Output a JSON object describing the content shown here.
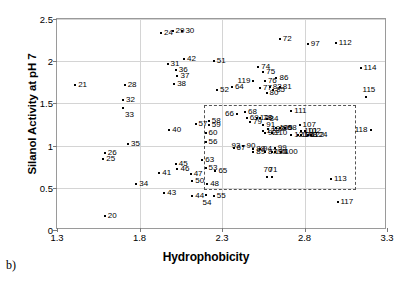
{
  "panel": {
    "letter": "b)"
  },
  "axes": {
    "xlabel": "Hydrophobicity",
    "ylabel": "Silanol Activity at pH 7",
    "xticks": [
      "1.3",
      "1.8",
      "2.3",
      "2.8",
      "3.3"
    ],
    "yticks": [
      "0",
      "0.5",
      "1",
      "1.5",
      "2",
      "2.5"
    ]
  },
  "chart_data": {
    "type": "scatter",
    "title": "",
    "xlabel": "Hydrophobicity",
    "ylabel": "Silanol Activity at pH 7",
    "xlim": [
      1.3,
      3.3
    ],
    "ylim": [
      0,
      2.5
    ],
    "xticks": [
      1.3,
      1.8,
      2.3,
      2.8,
      3.3
    ],
    "yticks": [
      0,
      0.5,
      1,
      1.5,
      2,
      2.5
    ],
    "grid": true,
    "legend": "none",
    "marker": "dot",
    "point_labels": true,
    "annotations": [
      {
        "type": "dashed-rectangle",
        "x0": 2.19,
        "x1": 3.11,
        "y0": 0.47,
        "y1": 1.48
      }
    ],
    "points": [
      {
        "label": "20",
        "x": 1.59,
        "y": 0.17,
        "lp": "lab-r"
      },
      {
        "label": "21",
        "x": 1.41,
        "y": 1.72,
        "lp": "lab-r"
      },
      {
        "label": "24",
        "x": 1.93,
        "y": 2.33,
        "lp": "lab-r"
      },
      {
        "label": "25",
        "x": 1.58,
        "y": 0.84,
        "lp": "lab-r"
      },
      {
        "label": "26",
        "x": 1.59,
        "y": 0.91,
        "lp": "lab-r"
      },
      {
        "label": "28",
        "x": 1.71,
        "y": 1.72,
        "lp": "lab-r"
      },
      {
        "label": "29",
        "x": 2.0,
        "y": 2.36,
        "lp": "lab-r"
      },
      {
        "label": "30",
        "x": 2.06,
        "y": 2.36,
        "lp": "lab-r"
      },
      {
        "label": "31",
        "x": 1.97,
        "y": 1.97,
        "lp": "lab-r"
      },
      {
        "label": "32",
        "x": 1.7,
        "y": 1.54,
        "lp": "lab-r"
      },
      {
        "label": "33",
        "x": 1.7,
        "y": 1.45,
        "lp": "lab-br"
      },
      {
        "label": "34",
        "x": 1.78,
        "y": 0.54,
        "lp": "lab-r"
      },
      {
        "label": "35",
        "x": 1.73,
        "y": 1.02,
        "lp": "lab-r"
      },
      {
        "label": "36",
        "x": 2.02,
        "y": 1.9,
        "lp": "lab-r"
      },
      {
        "label": "37",
        "x": 2.03,
        "y": 1.83,
        "lp": "lab-r"
      },
      {
        "label": "38",
        "x": 2.01,
        "y": 1.73,
        "lp": "lab-r"
      },
      {
        "label": "40",
        "x": 1.98,
        "y": 1.18,
        "lp": "lab-r"
      },
      {
        "label": "41",
        "x": 1.92,
        "y": 0.67,
        "lp": "lab-r"
      },
      {
        "label": "42",
        "x": 2.07,
        "y": 2.03,
        "lp": "lab-r"
      },
      {
        "label": "43",
        "x": 1.95,
        "y": 0.44,
        "lp": "lab-r"
      },
      {
        "label": "44",
        "x": 2.12,
        "y": 0.4,
        "lp": "lab-r"
      },
      {
        "label": "45",
        "x": 2.02,
        "y": 0.78,
        "lp": "lab-r"
      },
      {
        "label": "46",
        "x": 2.03,
        "y": 0.72,
        "lp": "lab-r"
      },
      {
        "label": "47",
        "x": 2.11,
        "y": 0.66,
        "lp": "lab-r"
      },
      {
        "label": "48",
        "x": 2.21,
        "y": 0.54,
        "lp": "lab-r"
      },
      {
        "label": "50",
        "x": 2.12,
        "y": 0.58,
        "lp": "lab-r"
      },
      {
        "label": "51",
        "x": 2.25,
        "y": 2.0,
        "lp": "lab-r"
      },
      {
        "label": "52",
        "x": 2.27,
        "y": 1.66,
        "lp": "lab-r"
      },
      {
        "label": "53",
        "x": 2.2,
        "y": 0.73,
        "lp": "lab-r"
      },
      {
        "label": "54",
        "x": 2.2,
        "y": 0.42,
        "lp": "lab-b"
      },
      {
        "label": "55",
        "x": 2.25,
        "y": 0.4,
        "lp": "lab-r"
      },
      {
        "label": "56",
        "x": 2.2,
        "y": 1.04,
        "lp": "lab-r"
      },
      {
        "label": "57",
        "x": 2.14,
        "y": 1.26,
        "lp": "lab-r"
      },
      {
        "label": "58",
        "x": 2.22,
        "y": 1.29,
        "lp": "lab-r"
      },
      {
        "label": "59",
        "x": 2.22,
        "y": 1.24,
        "lp": "lab-r"
      },
      {
        "label": "60",
        "x": 2.2,
        "y": 1.15,
        "lp": "lab-r"
      },
      {
        "label": "63",
        "x": 2.18,
        "y": 0.83,
        "lp": "lab-r"
      },
      {
        "label": "64",
        "x": 2.36,
        "y": 1.69,
        "lp": "lab-r"
      },
      {
        "label": "65",
        "x": 2.26,
        "y": 0.7,
        "lp": "lab-r"
      },
      {
        "label": "66",
        "x": 2.39,
        "y": 1.38,
        "lp": "lab-l"
      },
      {
        "label": "67",
        "x": 2.37,
        "y": 0.97,
        "lp": "lab-r"
      },
      {
        "label": "68",
        "x": 2.44,
        "y": 1.4,
        "lp": "lab-r"
      },
      {
        "label": "69",
        "x": 2.45,
        "y": 1.33,
        "lp": "lab-r"
      },
      {
        "label": "70",
        "x": 2.57,
        "y": 0.63,
        "lp": "lab-t"
      },
      {
        "label": "71",
        "x": 2.6,
        "y": 0.63,
        "lp": "lab-t"
      },
      {
        "label": "72",
        "x": 2.65,
        "y": 2.26,
        "lp": "lab-r"
      },
      {
        "label": "74",
        "x": 2.52,
        "y": 1.93,
        "lp": "lab-r"
      },
      {
        "label": "75",
        "x": 2.55,
        "y": 1.87,
        "lp": "lab-r"
      },
      {
        "label": "76",
        "x": 2.56,
        "y": 1.76,
        "lp": "lab-r"
      },
      {
        "label": "77",
        "x": 2.53,
        "y": 1.68,
        "lp": "lab-r"
      },
      {
        "label": "79",
        "x": 2.47,
        "y": 1.28,
        "lp": "lab-r"
      },
      {
        "label": "80",
        "x": 2.57,
        "y": 1.62,
        "lp": "lab-r"
      },
      {
        "label": "81",
        "x": 2.65,
        "y": 1.69,
        "lp": "lab-r"
      },
      {
        "label": "82",
        "x": 2.59,
        "y": 1.7,
        "lp": "lab-r"
      },
      {
        "label": "85",
        "x": 2.61,
        "y": 1.66,
        "lp": "lab-r"
      },
      {
        "label": "86",
        "x": 2.63,
        "y": 1.8,
        "lp": "lab-r"
      },
      {
        "label": "87",
        "x": 2.56,
        "y": 0.93,
        "lp": "lab-r"
      },
      {
        "label": "88",
        "x": 2.49,
        "y": 0.96,
        "lp": "lab-r"
      },
      {
        "label": "89",
        "x": 2.49,
        "y": 0.92,
        "lp": "lab-r"
      },
      {
        "label": "90",
        "x": 2.43,
        "y": 1.0,
        "lp": "lab-r"
      },
      {
        "label": "91",
        "x": 2.55,
        "y": 1.24,
        "lp": "lab-r"
      },
      {
        "label": "92",
        "x": 2.56,
        "y": 1.15,
        "lp": "lab-r"
      },
      {
        "label": "93",
        "x": 2.43,
        "y": 0.99,
        "lp": "lab-l"
      },
      {
        "label": "94",
        "x": 2.53,
        "y": 0.96,
        "lp": "lab-r"
      },
      {
        "label": "95",
        "x": 2.62,
        "y": 0.93,
        "lp": "lab-r"
      },
      {
        "label": "96",
        "x": 2.65,
        "y": 1.21,
        "lp": "lab-r"
      },
      {
        "label": "98",
        "x": 2.68,
        "y": 1.21,
        "lp": "lab-r"
      },
      {
        "label": "99",
        "x": 2.62,
        "y": 0.97,
        "lp": "lab-r"
      },
      {
        "label": "100",
        "x": 2.66,
        "y": 0.92,
        "lp": "lab-r"
      },
      {
        "label": "101",
        "x": 2.78,
        "y": 1.17,
        "lp": "lab-r"
      },
      {
        "label": "102",
        "x": 2.8,
        "y": 1.17,
        "lp": "lab-r"
      },
      {
        "label": "103",
        "x": 2.58,
        "y": 1.2,
        "lp": "lab-r"
      },
      {
        "label": "104",
        "x": 2.6,
        "y": 0.93,
        "lp": "lab-r"
      },
      {
        "label": "105",
        "x": 2.63,
        "y": 1.21,
        "lp": "lab-r"
      },
      {
        "label": "106",
        "x": 2.76,
        "y": 1.13,
        "lp": "lab-r"
      },
      {
        "label": "107",
        "x": 2.77,
        "y": 1.25,
        "lp": "lab-r"
      },
      {
        "label": "108",
        "x": 2.78,
        "y": 1.13,
        "lp": "lab-r"
      },
      {
        "label": "110",
        "x": 2.6,
        "y": 1.15,
        "lp": "lab-r"
      },
      {
        "label": "111",
        "x": 2.72,
        "y": 1.41,
        "lp": "lab-r"
      },
      {
        "label": "112",
        "x": 2.99,
        "y": 2.21,
        "lp": "lab-r"
      },
      {
        "label": "113",
        "x": 2.96,
        "y": 0.61,
        "lp": "lab-r"
      },
      {
        "label": "114",
        "x": 3.14,
        "y": 1.92,
        "lp": "lab-r"
      },
      {
        "label": "115",
        "x": 3.17,
        "y": 1.57,
        "lp": "lab-t"
      },
      {
        "label": "117",
        "x": 3.0,
        "y": 0.33,
        "lp": "lab-r"
      },
      {
        "label": "118",
        "x": 3.2,
        "y": 1.19,
        "lp": "lab-l"
      },
      {
        "label": "119",
        "x": 2.49,
        "y": 1.76,
        "lp": "lab-l"
      },
      {
        "label": "120",
        "x": 2.51,
        "y": 1.33,
        "lp": "lab-r"
      },
      {
        "label": "121",
        "x": 2.72,
        "y": 1.13,
        "lp": "lab-r"
      },
      {
        "label": "122",
        "x": 2.82,
        "y": 1.13,
        "lp": "lab-r"
      },
      {
        "label": "123",
        "x": 2.55,
        "y": 1.17,
        "lp": "lab-r"
      },
      {
        "label": "124",
        "x": 2.84,
        "y": 1.12,
        "lp": "lab-r"
      },
      {
        "label": "97",
        "x": 2.82,
        "y": 2.2,
        "lp": "lab-r"
      },
      {
        "label": "78",
        "x": 2.53,
        "y": 1.33,
        "lp": "lab-r"
      },
      {
        "label": "84",
        "x": 2.57,
        "y": 1.32,
        "lp": "lab-r"
      }
    ]
  }
}
